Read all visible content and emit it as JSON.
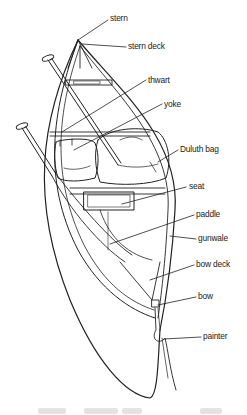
{
  "diagram": {
    "labels": [
      {
        "id": "stern",
        "text": "stern",
        "x": 110,
        "y": 12
      },
      {
        "id": "stern-deck",
        "text": "stern deck",
        "x": 128,
        "y": 40
      },
      {
        "id": "thwart",
        "text": "thwart",
        "x": 148,
        "y": 74
      },
      {
        "id": "yoke",
        "text": "yoke",
        "x": 164,
        "y": 98
      },
      {
        "id": "duluth-bag",
        "text": "Duluth bag",
        "x": 180,
        "y": 143
      },
      {
        "id": "seat",
        "text": "seat",
        "x": 189,
        "y": 180
      },
      {
        "id": "paddle",
        "text": "paddle",
        "x": 196,
        "y": 208
      },
      {
        "id": "gunwale",
        "text": "gunwale",
        "x": 198,
        "y": 232
      },
      {
        "id": "bow-deck",
        "text": "bow deck",
        "x": 196,
        "y": 258
      },
      {
        "id": "bow",
        "text": "bow",
        "x": 198,
        "y": 290
      },
      {
        "id": "painter",
        "text": "painter",
        "x": 203,
        "y": 330
      }
    ],
    "colors": {
      "line": "#222222",
      "background": "#ffffff",
      "caption": "#e3e3e3"
    }
  }
}
